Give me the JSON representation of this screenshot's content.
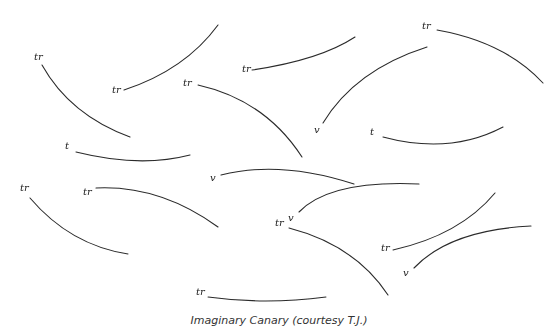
{
  "figure": {
    "caption": "Imaginary Canary (courtesy T.J.)",
    "stroke_color": "#2a2a2a",
    "phrases": [
      {
        "label": "tr",
        "lx": 34,
        "ly": 60,
        "d": "M42,65 Q70,115 130,137"
      },
      {
        "label": "tr",
        "lx": 112,
        "ly": 93,
        "d": "M124,90 Q185,70 218,25"
      },
      {
        "label": "tr",
        "lx": 242,
        "ly": 72,
        "d": "M252,70 Q320,60 355,37"
      },
      {
        "label": "tr",
        "lx": 422,
        "ly": 29,
        "d": "M437,30 Q505,42 543,83"
      },
      {
        "label": "tr",
        "lx": 183,
        "ly": 86,
        "d": "M198,85 Q265,100 302,157"
      },
      {
        "label": "v",
        "lx": 314,
        "ly": 133,
        "d": "M323,123 Q355,70 427,47"
      },
      {
        "label": "t",
        "lx": 370,
        "ly": 135,
        "d": "M383,137 Q450,155 503,127"
      },
      {
        "label": "t",
        "lx": 65,
        "ly": 149,
        "d": "M76,152 Q140,168 190,155"
      },
      {
        "label": "v",
        "lx": 210,
        "ly": 181,
        "d": "M221,175 Q280,160 354,184"
      },
      {
        "label": "tr",
        "lx": 20,
        "ly": 191,
        "d": "M30,198 Q70,245 128,254"
      },
      {
        "label": "tr",
        "lx": 83,
        "ly": 195,
        "d": "M96,188 Q160,185 218,227"
      },
      {
        "label": "tr",
        "lx": 275,
        "ly": 226,
        "d": "M289,228 Q355,245 388,295"
      },
      {
        "label": "v",
        "lx": 288,
        "ly": 221,
        "d": "M299,212 Q330,180 419,184"
      },
      {
        "label": "tr",
        "lx": 381,
        "ly": 251,
        "d": "M393,250 Q460,235 495,193"
      },
      {
        "label": "v",
        "lx": 403,
        "ly": 276,
        "d": "M414,268 Q450,230 531,226"
      },
      {
        "label": "tr",
        "lx": 196,
        "ly": 295,
        "d": "M208,297 Q265,305 326,297"
      }
    ]
  }
}
